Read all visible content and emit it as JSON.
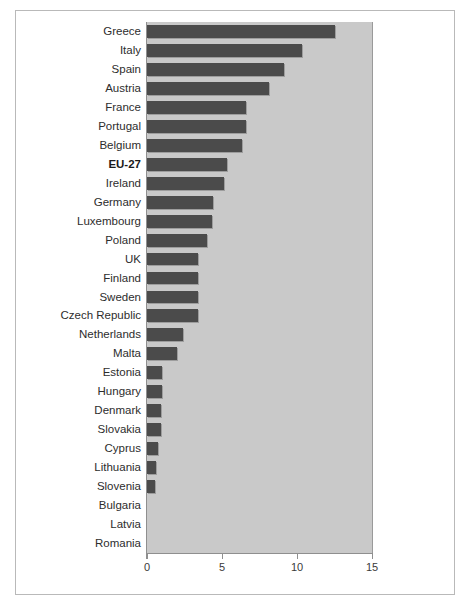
{
  "chart_data": {
    "type": "bar",
    "orientation": "horizontal",
    "title": "",
    "subtitle": "",
    "xlabel": "",
    "ylabel": "",
    "xlim": [
      0,
      15
    ],
    "ylim": null,
    "grid": false,
    "legend": null,
    "xticks": [
      0,
      5,
      10,
      15
    ],
    "xtick_labels": [
      "0",
      "5",
      "10",
      "15"
    ],
    "highlight_category": "EU-27",
    "categories": [
      "Greece",
      "Italy",
      "Spain",
      "Austria",
      "France",
      "Portugal",
      "Belgium",
      "EU-27",
      "Ireland",
      "Germany",
      "Luxembourg",
      "Poland",
      "UK",
      "Finland",
      "Sweden",
      "Czech Republic",
      "Netherlands",
      "Malta",
      "Estonia",
      "Hungary",
      "Denmark",
      "Slovakia",
      "Cyprus",
      "Lithuania",
      "Slovenia",
      "Bulgaria",
      "Latvia",
      "Romania"
    ],
    "values": [
      12.5,
      10.3,
      9.1,
      8.1,
      6.6,
      6.6,
      6.3,
      5.3,
      5.1,
      4.4,
      4.3,
      4.0,
      3.4,
      3.4,
      3.4,
      3.4,
      2.4,
      2.0,
      1.0,
      1.0,
      0.9,
      0.9,
      0.7,
      0.6,
      0.55,
      0.0,
      0.0,
      0.0
    ],
    "colors": {
      "bar": "#4b4b4b",
      "plot_background": "#c9c9c9",
      "figure_background": "#ffffff",
      "axis": "#8f8f8f",
      "label_text": "#2d2d2d",
      "frame": "#b9b9b9"
    }
  }
}
